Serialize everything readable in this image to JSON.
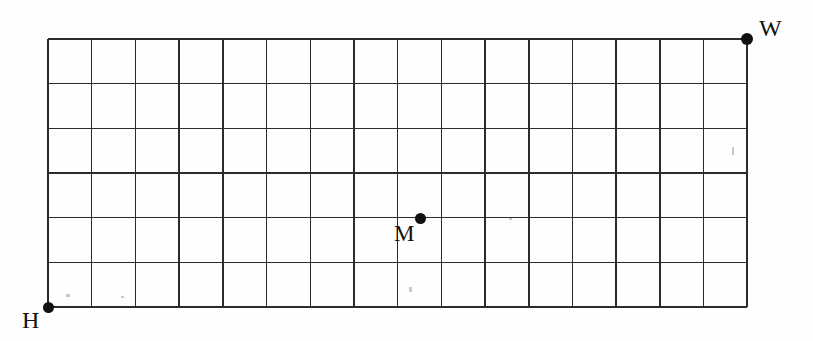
{
  "figure": {
    "background_color": "#fefefe",
    "line_color": "#2b2b2b",
    "point_color": "#111111"
  },
  "chart_data": {
    "type": "diagram",
    "subtype": "rectangular-grid",
    "title": "",
    "xlabel": "",
    "ylabel": "",
    "grid": {
      "columns": 16,
      "rows": 6,
      "x_left_px": 48,
      "x_right_px": 747,
      "y_top_px": 39,
      "y_bottom_px": 307,
      "cell_width_px": 43.7,
      "cell_height_px": 44.7,
      "grid_on": true,
      "vertical_line_x": [
        48,
        91.7,
        135.4,
        179.1,
        222.8,
        266.6,
        310.3,
        354.0,
        397.7,
        441.4,
        485.1,
        528.8,
        572.5,
        616.2,
        660.0,
        703.7,
        747
      ],
      "horizontal_line_y": [
        39,
        83.7,
        128.3,
        173.0,
        217.7,
        262.3,
        307
      ]
    },
    "points": [
      {
        "label": "H",
        "x_px": 48,
        "y_px": 307,
        "grid_col": 0,
        "grid_row": 6,
        "label_position": "lower-left",
        "corner": "bottom-left"
      },
      {
        "label": "M",
        "x_px": 420,
        "y_px": 218,
        "grid_col": 8,
        "grid_row": 4,
        "label_position": "lower-left",
        "corner": "interior-midpoint"
      },
      {
        "label": "W",
        "x_px": 747,
        "y_px": 39,
        "grid_col": 16,
        "grid_row": 0,
        "label_position": "upper-right",
        "corner": "top-right"
      }
    ],
    "legend": [],
    "annotations": []
  },
  "labels": {
    "H": "H",
    "M": "M",
    "W": "W"
  },
  "artifacts": [
    {
      "name": "speck-bottom-left",
      "x": 66,
      "y": 294,
      "w": 4,
      "h": 3
    },
    {
      "name": "speck-bottom-left-2",
      "x": 121,
      "y": 296,
      "w": 3,
      "h": 2
    },
    {
      "name": "speck-bottom-mid",
      "x": 409,
      "y": 287,
      "w": 3,
      "h": 5
    },
    {
      "name": "pen-mark-right",
      "x": 732,
      "y": 147,
      "w": 2,
      "h": 8
    },
    {
      "name": "speck-mid-right",
      "x": 509,
      "y": 218,
      "w": 3,
      "h": 2
    }
  ]
}
